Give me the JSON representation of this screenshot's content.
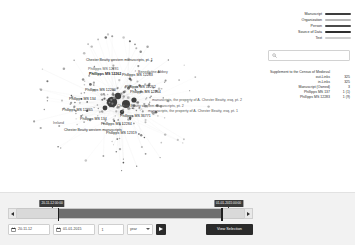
{
  "legend": {
    "items": [
      {
        "label": "Manuscript",
        "color": "#3d3d3d"
      },
      {
        "label": "Organization",
        "color": "#b9b9b9"
      },
      {
        "label": "Person",
        "color": "#4a4a4a"
      },
      {
        "label": "Source of Data",
        "color": "#2f2f2f"
      },
      {
        "label": "Text",
        "color": "#cfcfcf"
      }
    ]
  },
  "search": {
    "placeholder": "",
    "value": "",
    "icon": "search-icon"
  },
  "stats": {
    "rows": [
      {
        "key": "Supplement to the Census of Medieval",
        "value": ""
      },
      {
        "key": "out-Links",
        "value": "325"
      },
      {
        "key": "in-Links",
        "value": "325"
      },
      {
        "key": "Manuscript (Owned)",
        "value": "3"
      },
      {
        "key": "Phillipps MS 137",
        "value": "1 (1)"
      },
      {
        "key": "Phillipps MS 12283",
        "value": "1 (9)"
      }
    ]
  },
  "graph": {
    "labels": [
      {
        "text": "Chester Beatty western manuscripts, pt. 1",
        "x": 86,
        "y": 58,
        "bold": false,
        "dim": false
      },
      {
        "text": "Phillipps MS 12281",
        "x": 88,
        "y": 67,
        "bold": false,
        "dim": true
      },
      {
        "text": "Benedictine Abbey",
        "x": 138,
        "y": 70,
        "bold": false,
        "dim": true
      },
      {
        "text": "Phillipps MS 12262",
        "x": 89,
        "y": 72,
        "bold": true,
        "dim": false
      },
      {
        "text": "Phillipps MS 12283",
        "x": 122,
        "y": 73,
        "bold": false,
        "dim": false
      },
      {
        "text": "Phillipps MS 12262",
        "x": 125,
        "y": 85,
        "bold": false,
        "dim": false
      },
      {
        "text": "Phillipps MS 12260",
        "x": 85,
        "y": 88,
        "bold": false,
        "dim": false
      },
      {
        "text": "Phillipps MS 12264",
        "x": 130,
        "y": 90,
        "bold": false,
        "dim": false
      },
      {
        "text": "Phillipps MS 134",
        "x": 69,
        "y": 97,
        "bold": false,
        "dim": false
      },
      {
        "text": "manuscripts, the property of A. Chester Beatty, esq, pt. 2",
        "x": 152,
        "y": 98,
        "bold": false,
        "dim": true
      },
      {
        "text": "Chester Beatty western manuscripts, pt. 2",
        "x": 117,
        "y": 104,
        "bold": false,
        "dim": true
      },
      {
        "text": "Phillipps MS 12265",
        "x": 62,
        "y": 108,
        "bold": false,
        "dim": false
      },
      {
        "text": "manuscripts, the property of A. Chester Beatty, esq, pt. 1",
        "x": 148,
        "y": 109,
        "bold": false,
        "dim": true
      },
      {
        "text": "Phillipps MS 36771",
        "x": 120,
        "y": 114,
        "bold": false,
        "dim": false
      },
      {
        "text": "Phillipps MS 134",
        "x": 80,
        "y": 117,
        "bold": false,
        "dim": false
      },
      {
        "text": "Ireland",
        "x": 53,
        "y": 121,
        "bold": false,
        "dim": true
      },
      {
        "text": "Phillipps MS 12284",
        "x": 101,
        "y": 122,
        "bold": false,
        "dim": false
      },
      {
        "text": "Chester Beatty western manuscripts",
        "x": 64,
        "y": 128,
        "bold": false,
        "dim": false
      },
      {
        "text": "Phillipps MS 12319",
        "x": 106,
        "y": 131,
        "bold": false,
        "dim": false
      }
    ]
  },
  "timeline": {
    "start_flag": "20-11-12 00:00",
    "end_flag": "01-01-2015 00:00",
    "left_arrow": "◀",
    "right_arrow": "▶"
  },
  "controls": {
    "date_from": "20-11-12",
    "date_to": "01-01-2015",
    "step_value": "1",
    "step_unit": "year",
    "play_label": "play",
    "view_selection_label": "View Selection"
  }
}
